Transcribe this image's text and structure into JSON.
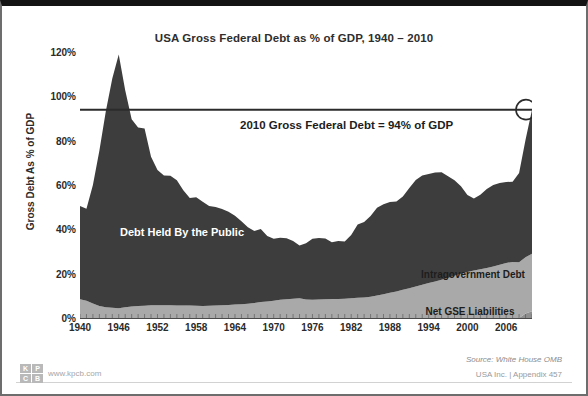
{
  "slide": {
    "source_note": "Source: White House OMB",
    "appendix_note": "USA Inc. | Appendix  457",
    "brand": {
      "url": "www.kpcb.com",
      "mark": [
        "K",
        "P",
        "C",
        "B"
      ]
    }
  },
  "chart_data": {
    "type": "area",
    "title": "USA Gross Federal Debt  as % of GDP, 1940 – 2010",
    "xlabel": "",
    "ylabel": "Gross Debt As % of GDP",
    "stacked": true,
    "grid": false,
    "legend": "in-plot labels",
    "xlim": [
      1940,
      2010
    ],
    "ylim": [
      0,
      120
    ],
    "yticks": [
      "0%",
      "20%",
      "40%",
      "60%",
      "80%",
      "100%",
      "120%"
    ],
    "ytick_values": [
      0,
      20,
      40,
      60,
      80,
      100,
      120
    ],
    "xticks": [
      "1940",
      "1946",
      "1952",
      "1958",
      "1964",
      "1970",
      "1976",
      "1982",
      "1988",
      "1994",
      "2000",
      "2006"
    ],
    "xtick_values": [
      1940,
      1946,
      1952,
      1958,
      1964,
      1970,
      1976,
      1982,
      1988,
      1994,
      2000,
      2006
    ],
    "annotations": [
      {
        "name": "callout",
        "text": "2010 Gross Federal Debt = 94% of GDP"
      },
      {
        "name": "series-label-public",
        "text": "Debt Held By the Public"
      },
      {
        "name": "series-label-intragov",
        "text": "Intragovernment Debt"
      },
      {
        "name": "series-label-gse",
        "text": "Net GSE Liabilities"
      }
    ],
    "reference_line": {
      "value": 94,
      "label": "94% of GDP",
      "marker": "circle at 2010"
    },
    "colors": {
      "debt_held_by_public": "#3d3d3d",
      "intragovernment_debt": "#a9a9a9",
      "net_gse_liabilities": "#8f8f8f",
      "reference_line": "#2b2b2b",
      "background": "#ffffff"
    },
    "x": [
      1940,
      1941,
      1942,
      1943,
      1944,
      1945,
      1946,
      1947,
      1948,
      1949,
      1950,
      1951,
      1952,
      1953,
      1954,
      1955,
      1956,
      1957,
      1958,
      1959,
      1960,
      1961,
      1962,
      1963,
      1964,
      1965,
      1966,
      1967,
      1968,
      1969,
      1970,
      1971,
      1972,
      1973,
      1974,
      1975,
      1976,
      1977,
      1978,
      1979,
      1980,
      1981,
      1982,
      1983,
      1984,
      1985,
      1986,
      1987,
      1988,
      1989,
      1990,
      1991,
      1992,
      1993,
      1994,
      1995,
      1996,
      1997,
      1998,
      1999,
      2000,
      2001,
      2002,
      2003,
      2004,
      2005,
      2006,
      2007,
      2008,
      2009,
      2010
    ],
    "series": [
      {
        "name": "Net GSE Liabilities",
        "values": [
          0,
          0,
          0,
          0,
          0,
          0,
          0,
          0,
          0,
          0,
          0,
          0,
          0,
          0,
          0,
          0,
          0,
          0,
          0,
          0,
          0,
          0,
          0,
          0,
          0,
          0,
          0,
          0,
          0,
          0,
          0,
          0,
          0,
          0,
          0,
          0,
          0,
          0,
          0,
          0,
          0,
          0,
          0,
          0,
          0,
          0,
          0,
          0,
          0,
          0,
          0,
          0,
          0,
          0,
          0,
          0,
          0,
          0,
          0,
          0,
          0,
          0,
          0,
          0,
          0,
          0,
          0,
          0,
          0,
          2,
          3
        ]
      },
      {
        "name": "Intragovernment Debt",
        "values": [
          8.5,
          7.8,
          6.5,
          5.4,
          4.8,
          4.6,
          4.4,
          4.8,
          5.2,
          5.4,
          5.5,
          5.7,
          5.8,
          5.8,
          5.7,
          5.6,
          5.6,
          5.6,
          5.5,
          5.4,
          5.5,
          5.6,
          5.7,
          5.9,
          6.1,
          6.2,
          6.4,
          6.8,
          7.2,
          7.5,
          7.8,
          8.2,
          8.5,
          8.7,
          8.9,
          8.4,
          8.2,
          8.3,
          8.5,
          8.6,
          8.6,
          8.7,
          8.9,
          9.1,
          9.3,
          9.6,
          10.1,
          10.7,
          11.4,
          12.0,
          12.7,
          13.4,
          14.2,
          15.0,
          15.8,
          16.5,
          17.3,
          18.1,
          19.1,
          20.0,
          20.8,
          21.4,
          22.0,
          22.6,
          23.2,
          24.0,
          24.8,
          25.3,
          25.2,
          25.4,
          26.0
        ]
      },
      {
        "name": "Debt Held By the Public",
        "values": [
          42.0,
          41.5,
          53.5,
          70.0,
          88.5,
          103.5,
          114.5,
          98.0,
          84.5,
          80.5,
          80.0,
          67.0,
          61.0,
          58.5,
          58.5,
          56.5,
          52.0,
          48.5,
          49.0,
          47.0,
          45.0,
          44.5,
          43.5,
          42.0,
          40.0,
          37.5,
          34.5,
          32.5,
          33.0,
          29.5,
          28.0,
          28.0,
          27.5,
          26.0,
          23.8,
          25.3,
          27.5,
          27.8,
          27.4,
          25.6,
          26.1,
          25.8,
          28.6,
          33.1,
          34.0,
          36.4,
          39.6,
          40.6,
          40.9,
          40.6,
          42.1,
          45.3,
          48.1,
          49.3,
          49.2,
          49.1,
          48.4,
          45.9,
          43.0,
          39.4,
          34.7,
          32.5,
          33.6,
          35.6,
          36.8,
          36.9,
          36.5,
          36.2,
          40.2,
          53.0,
          65.0
        ]
      }
    ]
  }
}
